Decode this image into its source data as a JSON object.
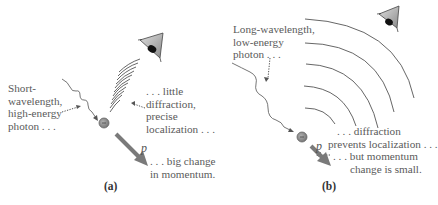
{
  "panel_a": {
    "caption": "(a)",
    "photon_label": [
      "Short-",
      "wavelength,",
      "high-energy",
      "photon . . ."
    ],
    "diffraction_label": [
      ". . . little",
      "diffraction,",
      "precise",
      "localization . . ."
    ],
    "momentum_label": [
      ". . . big change",
      "in momentum."
    ],
    "momentum_symbol": "p⃗"
  },
  "panel_b": {
    "caption": "(b)",
    "photon_label": [
      "Long-wavelength,",
      "low-energy",
      "photon . . ."
    ],
    "diffraction_label": [
      ". . . diffraction",
      "prevents localization . . ."
    ],
    "momentum_label": [
      ". . . but momentum",
      "change is small."
    ],
    "momentum_symbol": "p⃗"
  },
  "colors": {
    "text": "#5a5a5a",
    "lines": "#666666",
    "arrow": "#777777",
    "electron": "#888888",
    "eye_fill": "#aaaaaa"
  }
}
